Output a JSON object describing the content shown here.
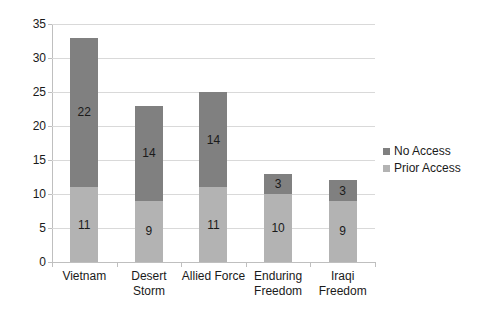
{
  "chart_data": {
    "type": "bar",
    "subtype": "stacked-bar",
    "title": "",
    "xlabel": "",
    "ylabel": "",
    "ylim": [
      0,
      35
    ],
    "ytick_step": 5,
    "yticks": [
      0,
      5,
      10,
      15,
      20,
      25,
      30,
      35
    ],
    "grid": true,
    "legend_position": "right",
    "categories": [
      "Vietnam",
      "Desert Storm",
      "Allied Force",
      "Enduring Freedom",
      "Iraqi Freedom"
    ],
    "category_lines": [
      [
        "Vietnam"
      ],
      [
        "Desert",
        "Storm"
      ],
      [
        "Allied Force"
      ],
      [
        "Enduring",
        "Freedom"
      ],
      [
        "Iraqi",
        "Freedom"
      ]
    ],
    "series": [
      {
        "name": "Prior Access",
        "color": "#b3b3b3",
        "stack_position": "bottom",
        "values": [
          11,
          9,
          11,
          10,
          9
        ]
      },
      {
        "name": "No Access",
        "color": "#808080",
        "stack_position": "top",
        "values": [
          22,
          14,
          14,
          3,
          3
        ]
      }
    ],
    "totals": [
      33,
      23,
      25,
      13,
      12
    ]
  },
  "axis": {
    "y_tick_labels": [
      "35",
      "30",
      "25",
      "20",
      "15",
      "10",
      "5",
      "0"
    ]
  },
  "legend": {
    "items": [
      {
        "label": "No Access",
        "color": "#808080"
      },
      {
        "label": "Prior Access",
        "color": "#b3b3b3"
      }
    ]
  },
  "colors": {
    "no_access": "#808080",
    "prior_access": "#b3b3b3",
    "gridline": "#d9d9d9",
    "axis": "#bfbfbf",
    "text": "#1a1a1a",
    "background": "#ffffff"
  }
}
